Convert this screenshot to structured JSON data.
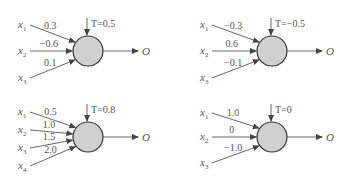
{
  "perceptrons": [
    {
      "threshold_label": "T=0.5",
      "output_label": "O",
      "inputs": [
        {
          "var": "x",
          "sub": "1",
          "weight": "0.3"
        },
        {
          "var": "x",
          "sub": "2",
          "weight": "−0.6"
        },
        {
          "var": "x",
          "sub": "3",
          "weight": "0.1"
        }
      ]
    },
    {
      "threshold_label": "T=−0.5",
      "output_label": "O",
      "inputs": [
        {
          "var": "x",
          "sub": "1",
          "weight": "−0.3"
        },
        {
          "var": "x",
          "sub": "2",
          "weight": "0.6"
        },
        {
          "var": "x",
          "sub": "3",
          "weight": "−0.1"
        }
      ]
    },
    {
      "threshold_label": "T=0.8",
      "output_label": "O",
      "inputs": [
        {
          "var": "x",
          "sub": "1",
          "weight": "0.5"
        },
        {
          "var": "x",
          "sub": "2",
          "weight": "1.0"
        },
        {
          "var": "x",
          "sub": "3",
          "weight": "1.5"
        },
        {
          "var": "x",
          "sub": "4",
          "weight": "2.0"
        }
      ]
    },
    {
      "threshold_label": "T=0",
      "output_label": "O",
      "inputs": [
        {
          "var": "x",
          "sub": "1",
          "weight": "1.0"
        },
        {
          "var": "x",
          "sub": "2",
          "weight": "0"
        },
        {
          "var": "x",
          "sub": "3",
          "weight": "−1.0"
        }
      ]
    }
  ]
}
